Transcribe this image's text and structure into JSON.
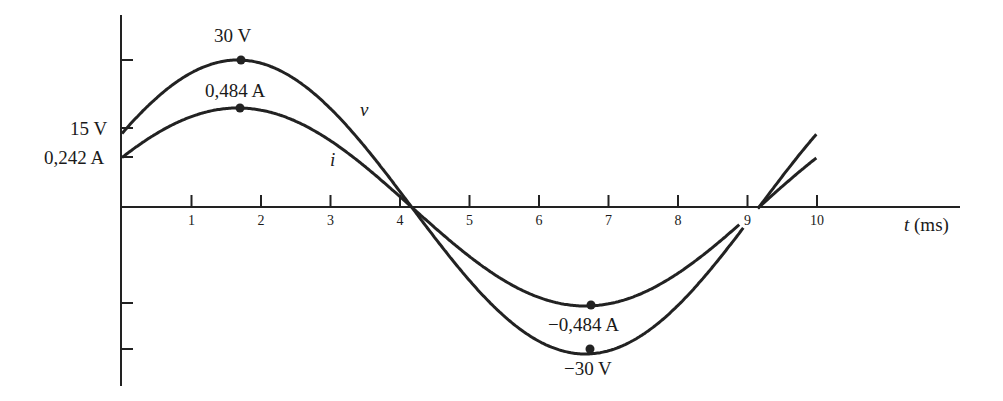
{
  "chart_data": {
    "type": "line",
    "title": "",
    "xlabel": "t (ms)",
    "ylabel": "",
    "xlim": [
      0,
      10
    ],
    "x_ticks": [
      1,
      2,
      3,
      4,
      5,
      6,
      7,
      8,
      9,
      10
    ],
    "grid": false,
    "legend": "inline curve labels",
    "series": [
      {
        "name": "v",
        "unit": "V",
        "amplitude": 30,
        "period_ms": 10,
        "phase_deg": 30,
        "x": [
          0,
          1,
          1.667,
          2,
          3,
          4,
          4.167,
          5,
          6,
          6.667,
          7,
          8,
          9,
          9.167,
          10
        ],
        "values": [
          15,
          28.9,
          30,
          29.8,
          20.1,
          3.1,
          0,
          -15,
          -28.9,
          -30,
          -29.8,
          -20.1,
          -3.1,
          0,
          15
        ]
      },
      {
        "name": "i",
        "unit": "A",
        "amplitude": 0.484,
        "period_ms": 10,
        "phase_deg": 30,
        "x": [
          0,
          1,
          1.667,
          2,
          3,
          4,
          4.167,
          5,
          6,
          6.667,
          7,
          8,
          9,
          9.167,
          10
        ],
        "values": [
          0.242,
          0.466,
          0.484,
          0.481,
          0.324,
          0.05,
          0,
          -0.242,
          -0.466,
          -0.484,
          -0.481,
          -0.324,
          -0.05,
          0,
          0.242
        ]
      }
    ],
    "annotations": [
      {
        "text": "30 V",
        "x": 1.667,
        "y": 30,
        "series": "v",
        "marker": true
      },
      {
        "text": "0,484 A",
        "x": 1.667,
        "y": 0.484,
        "series": "i",
        "marker": true
      },
      {
        "text": "−0,484 A",
        "x": 6.667,
        "y": -0.484,
        "series": "i",
        "marker": true
      },
      {
        "text": "−30 V",
        "x": 6.667,
        "y": -30,
        "series": "v",
        "marker": true
      },
      {
        "text": "15 V",
        "x": 0,
        "y": 15,
        "series": "v",
        "axis_label": true
      },
      {
        "text": "0,242 A",
        "x": 0,
        "y": 0.242,
        "series": "i",
        "axis_label": true
      }
    ]
  },
  "labels": {
    "peak_v": "30 V",
    "peak_i": "0,484 A",
    "trough_i": "−0,484 A",
    "trough_v": "−30 V",
    "y_v0": "15 V",
    "y_i0": "0,242 A",
    "curve_v": "v",
    "curve_i": "i",
    "x_axis_var": "t",
    "x_axis_unit": "(ms)",
    "ticks": [
      "1",
      "2",
      "3",
      "4",
      "5",
      "6",
      "7",
      "8",
      "9",
      "10"
    ]
  }
}
